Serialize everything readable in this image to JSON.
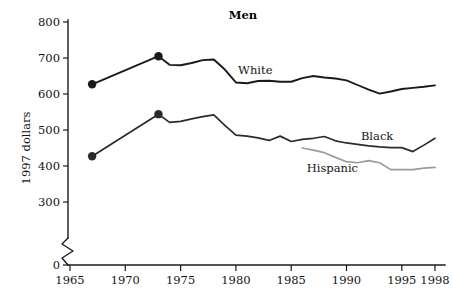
{
  "chart_data": {
    "type": "line",
    "title": "Men",
    "xlabel": "",
    "ylabel": "1997 dollars",
    "xlim": [
      1964.2,
      1998.6
    ],
    "ylim": [
      280,
      810
    ],
    "grid": false,
    "legend_position": "inline-right",
    "y_ticks": [
      {
        "value": 800,
        "label": "800"
      },
      {
        "value": 700,
        "label": "700"
      },
      {
        "value": 600,
        "label": "600"
      },
      {
        "value": 500,
        "label": "500"
      },
      {
        "value": 400,
        "label": "400"
      },
      {
        "value": 300,
        "label": "300"
      },
      {
        "value": 0,
        "label": "0"
      }
    ],
    "x_ticks": [
      {
        "value": 1965,
        "label": "1965"
      },
      {
        "value": 1970,
        "label": "1970"
      },
      {
        "value": 1975,
        "label": "1975"
      },
      {
        "value": 1980,
        "label": "1980"
      },
      {
        "value": 1985,
        "label": "1985"
      },
      {
        "value": 1990,
        "label": "1990"
      },
      {
        "value": 1995,
        "label": "1995"
      },
      {
        "value": 1998,
        "label": "1998"
      }
    ],
    "y_axis_break": true,
    "series": [
      {
        "name": "White",
        "label": "White",
        "color": "#1a1a1a",
        "width": 1.9,
        "label_x": 1980.2,
        "label_y": 655,
        "x": [
          1967,
          1973,
          1974,
          1975,
          1976,
          1977,
          1978,
          1979,
          1980,
          1981,
          1982,
          1983,
          1984,
          1985,
          1986,
          1987,
          1988,
          1989,
          1990,
          1991,
          1992,
          1993,
          1994,
          1995,
          1996,
          1997,
          1998
        ],
        "values": [
          627,
          705,
          681,
          680,
          686,
          694,
          696,
          668,
          632,
          630,
          636,
          637,
          634,
          634,
          644,
          650,
          646,
          643,
          638,
          625,
          612,
          601,
          607,
          614,
          617,
          620,
          624
        ],
        "markers": [
          {
            "x": 1967,
            "y": 627
          },
          {
            "x": 1973,
            "y": 705
          }
        ]
      },
      {
        "name": "Black",
        "label": "Black",
        "color": "#2b2b2b",
        "width": 1.7,
        "label_x": 1991.3,
        "label_y": 472,
        "x": [
          1967,
          1973,
          1974,
          1975,
          1976,
          1977,
          1978,
          1979,
          1980,
          1981,
          1982,
          1983,
          1984,
          1985,
          1986,
          1987,
          1988,
          1989,
          1990,
          1991,
          1992,
          1993,
          1994,
          1995,
          1996,
          1997,
          1998
        ],
        "values": [
          427,
          544,
          521,
          524,
          531,
          537,
          542,
          513,
          486,
          483,
          478,
          471,
          483,
          468,
          474,
          477,
          482,
          470,
          464,
          460,
          456,
          453,
          451,
          451,
          440,
          458,
          477
        ],
        "markers": [
          {
            "x": 1967,
            "y": 427
          },
          {
            "x": 1973,
            "y": 544
          }
        ]
      },
      {
        "name": "Hispanic",
        "label": "Hispanic",
        "color": "#9b9b9b",
        "width": 1.7,
        "label_x": 1986.4,
        "label_y": 383,
        "x": [
          1986,
          1987,
          1988,
          1989,
          1990,
          1991,
          1992,
          1993,
          1994,
          1995,
          1996,
          1997,
          1998
        ],
        "values": [
          450,
          444,
          437,
          424,
          412,
          409,
          415,
          409,
          390,
          390,
          390,
          394,
          396
        ],
        "markers": []
      }
    ]
  }
}
